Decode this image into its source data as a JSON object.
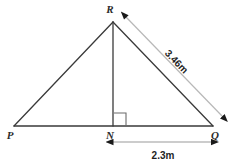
{
  "diagram": {
    "type": "geometry-triangle",
    "background_color": "#ffffff",
    "stroke_color": "#3a3a3a",
    "dimension_line_color": "#b8b8b8",
    "arrowhead_color": "#1a1a1a",
    "vertices": [
      {
        "id": "R",
        "label": "R",
        "x": 113,
        "y": 22,
        "label_x": 110,
        "label_y": 13
      },
      {
        "id": "P",
        "label": "P",
        "x": 14,
        "y": 126,
        "label_x": 10,
        "label_y": 138
      },
      {
        "id": "N",
        "label": "N",
        "x": 113,
        "y": 126,
        "label_x": 108,
        "label_y": 138
      },
      {
        "id": "Q",
        "label": "Q",
        "x": 213,
        "y": 126,
        "label_x": 212,
        "label_y": 138
      }
    ],
    "edges": [
      {
        "name": "side-PR",
        "from": "P",
        "to": "R"
      },
      {
        "name": "side-RQ",
        "from": "R",
        "to": "Q"
      },
      {
        "name": "base-PQ",
        "from": "P",
        "to": "Q"
      },
      {
        "name": "altitude-RN",
        "from": "R",
        "to": "N"
      }
    ],
    "right_angle": {
      "at": "N",
      "size": 12,
      "x": 114,
      "y": 113
    },
    "measurements": [
      {
        "name": "hypotenuse-measure",
        "label": "3.46m",
        "unit": "m",
        "value": 3.46,
        "between": [
          "R",
          "Q"
        ],
        "orientation": "diagonal",
        "text_rotation_deg": 46,
        "text_x": 172,
        "text_y": 63,
        "arrow_style": "double-headed",
        "line_from_x": 126,
        "line_from_y": 17,
        "line_to_x": 223,
        "line_to_y": 117
      },
      {
        "name": "base-measure",
        "label": "2.3m",
        "unit": "m",
        "value": 2.3,
        "between": [
          "N",
          "Q"
        ],
        "orientation": "horizontal",
        "text_rotation_deg": 0,
        "text_x": 163,
        "text_y": 159,
        "arrow_style": "double-headed",
        "line_from_x": 113,
        "line_from_y": 142,
        "line_to_x": 212,
        "line_to_y": 142
      }
    ]
  }
}
